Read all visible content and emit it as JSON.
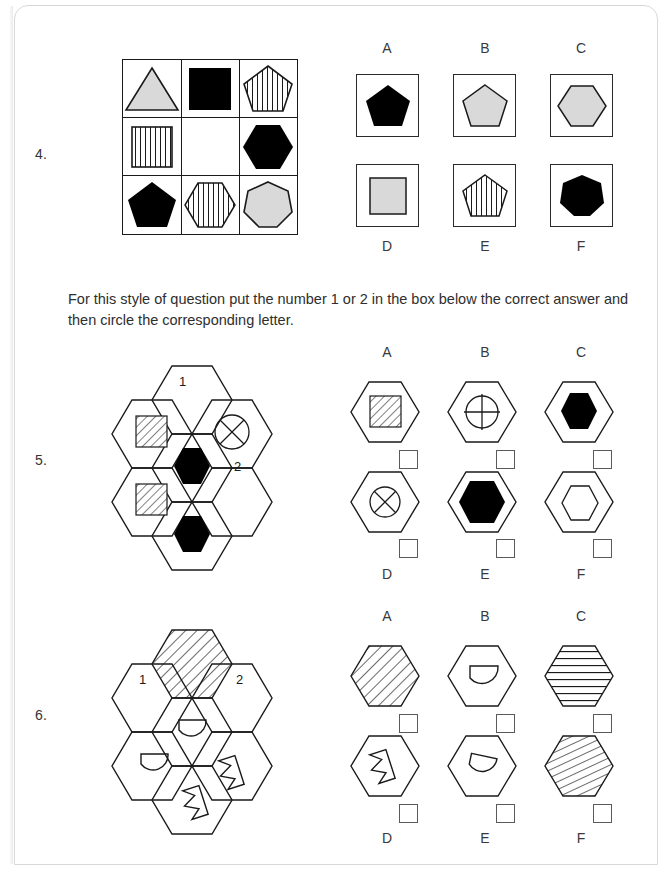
{
  "page": {
    "background": "#ffffff",
    "ink": "#1a1a1a",
    "gray_fill": "#d9d9d9",
    "black_fill": "#000000"
  },
  "instruction": {
    "text": "For this style of question put the number 1 or 2 in the box below the correct answer and then circle the corresponding letter."
  },
  "questions": [
    {
      "number": "4.",
      "type": "matrix-3x3",
      "matrix": [
        {
          "shape": "triangle",
          "fill": "gray",
          "pattern": "none"
        },
        {
          "shape": "square",
          "fill": "black",
          "pattern": "none"
        },
        {
          "shape": "pentagon",
          "fill": "white",
          "pattern": "vertical-stripes"
        },
        {
          "shape": "square",
          "fill": "white",
          "pattern": "vertical-stripes"
        },
        {
          "shape": "empty",
          "fill": "none",
          "pattern": "none"
        },
        {
          "shape": "hexagon",
          "fill": "black",
          "pattern": "none"
        },
        {
          "shape": "pentagon",
          "fill": "black",
          "pattern": "none"
        },
        {
          "shape": "hexagon",
          "fill": "white",
          "pattern": "vertical-stripes"
        },
        {
          "shape": "heptagon",
          "fill": "gray",
          "pattern": "none"
        }
      ],
      "options": [
        {
          "letter": "A",
          "shape": "pentagon",
          "fill": "black",
          "pattern": "none"
        },
        {
          "letter": "B",
          "shape": "pentagon",
          "fill": "gray",
          "pattern": "none"
        },
        {
          "letter": "C",
          "shape": "hexagon",
          "fill": "gray",
          "pattern": "none"
        },
        {
          "letter": "D",
          "shape": "square",
          "fill": "gray",
          "pattern": "none"
        },
        {
          "letter": "E",
          "shape": "pentagon",
          "fill": "white",
          "pattern": "vertical-stripes"
        },
        {
          "letter": "F",
          "shape": "heptagon",
          "fill": "black",
          "pattern": "none"
        }
      ]
    },
    {
      "number": "5.",
      "type": "hex-cluster",
      "cluster": [
        {
          "position": "top",
          "content": "blank",
          "marker": "1"
        },
        {
          "position": "upper-left",
          "content": "hatched-square",
          "marker": ""
        },
        {
          "position": "upper-right",
          "content": "circle-x",
          "marker": ""
        },
        {
          "position": "center",
          "content": "black-hexagon",
          "marker": ""
        },
        {
          "position": "lower-left",
          "content": "hatched-square",
          "marker": ""
        },
        {
          "position": "lower-right",
          "content": "blank",
          "marker": "2"
        },
        {
          "position": "bottom",
          "content": "black-hexagon",
          "marker": ""
        }
      ],
      "options": [
        {
          "letter": "A",
          "content": "hatched-square",
          "box": ""
        },
        {
          "letter": "B",
          "content": "circle-plus",
          "box": ""
        },
        {
          "letter": "C",
          "content": "black-hexagon-small",
          "box": ""
        },
        {
          "letter": "D",
          "content": "circle-x",
          "box": ""
        },
        {
          "letter": "E",
          "content": "black-hexagon",
          "box": ""
        },
        {
          "letter": "F",
          "content": "white-hexagon",
          "box": ""
        }
      ]
    },
    {
      "number": "6.",
      "type": "hex-cluster",
      "cluster": [
        {
          "position": "top",
          "content": "diagonal-hatch",
          "marker": ""
        },
        {
          "position": "upper-left",
          "content": "blank",
          "marker": "1"
        },
        {
          "position": "upper-right",
          "content": "blank",
          "marker": "2"
        },
        {
          "position": "center",
          "content": "half-moon",
          "marker": ""
        },
        {
          "position": "lower-left",
          "content": "half-moon",
          "marker": ""
        },
        {
          "position": "lower-right",
          "content": "arrow-left",
          "marker": ""
        },
        {
          "position": "bottom",
          "content": "arrow-left",
          "marker": ""
        }
      ],
      "options": [
        {
          "letter": "A",
          "content": "diagonal-hatch",
          "box": ""
        },
        {
          "letter": "B",
          "content": "half-moon",
          "box": ""
        },
        {
          "letter": "C",
          "content": "horizontal-lines",
          "box": ""
        },
        {
          "letter": "D",
          "content": "arrow-left",
          "box": ""
        },
        {
          "letter": "E",
          "content": "half-moon-rotated",
          "box": ""
        },
        {
          "letter": "F",
          "content": "diagonal-hatch-steep",
          "box": ""
        }
      ]
    }
  ]
}
